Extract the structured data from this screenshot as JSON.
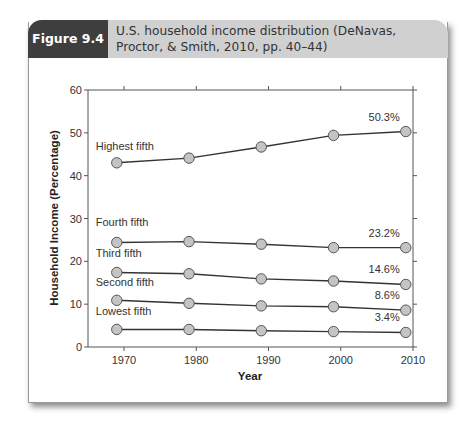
{
  "header": {
    "figure_label": "Figure 9.4",
    "title": "U.S. household income distribution (DeNavas, Proctor, & Smith, 2010, pp. 40–44)"
  },
  "chart_data": {
    "type": "line",
    "title": "U.S. household income distribution (DeNavas, Proctor, & Smith, 2010, pp. 40–44)",
    "xlabel": "Year",
    "ylabel": "Household Income (Percentage)",
    "xlim": [
      1965,
      2010
    ],
    "ylim": [
      0,
      60
    ],
    "xticks": [
      1970,
      1980,
      1990,
      2000,
      2010
    ],
    "yticks": [
      0,
      10,
      20,
      30,
      40,
      50,
      60
    ],
    "x": [
      1969,
      1979,
      1989,
      1999,
      2009
    ],
    "series": [
      {
        "name": "Highest fifth",
        "values": [
          43.0,
          44.1,
          46.7,
          49.4,
          50.3
        ],
        "end_label": "50.3%"
      },
      {
        "name": "Fourth fifth",
        "values": [
          24.4,
          24.6,
          24.0,
          23.2,
          23.2
        ],
        "end_label": "23.2%"
      },
      {
        "name": "Third fifth",
        "values": [
          17.4,
          17.1,
          15.9,
          15.4,
          14.6
        ],
        "end_label": "14.6%"
      },
      {
        "name": "Second fifth",
        "values": [
          10.9,
          10.2,
          9.6,
          9.4,
          8.6
        ],
        "end_label": "8.6%"
      },
      {
        "name": "Lowest fifth",
        "values": [
          4.1,
          4.1,
          3.8,
          3.6,
          3.4
        ],
        "end_label": "3.4%"
      }
    ],
    "grid": false,
    "legend": "inline labels"
  }
}
